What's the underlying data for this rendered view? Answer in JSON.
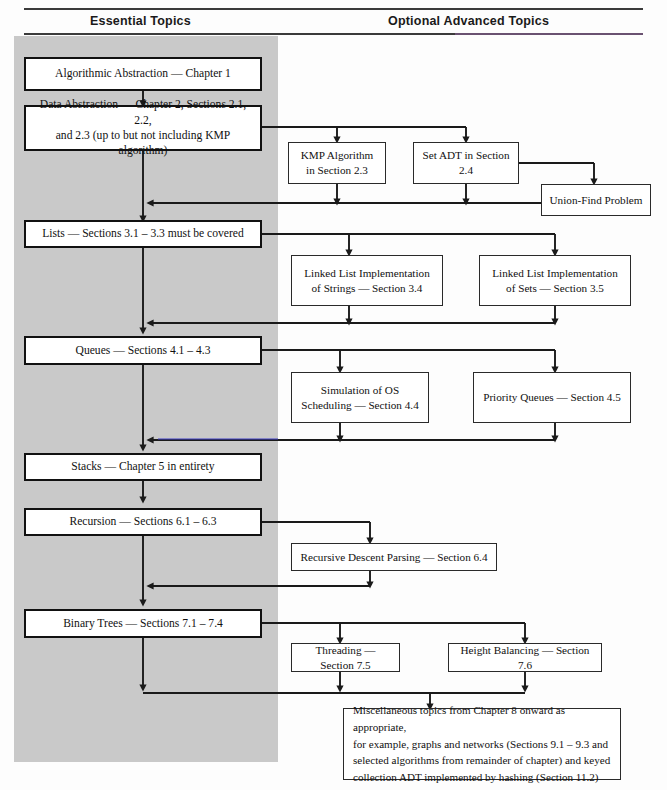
{
  "page": {
    "width": 667,
    "height": 790,
    "background": "#fdfdfd",
    "panel_color": "#c9c9c9",
    "line_color": "#1a1a1a"
  },
  "headers": {
    "left": "Essential Topics",
    "right": "Optional Advanced Topics"
  },
  "essential": {
    "algorithmic_abstraction": "Algorithmic Abstraction — Chapter 1",
    "data_abstraction": "Data Abstraction — Chapter 2, Sections 2.1, 2.2,\nand 2.3 (up to but not including KMP algorithm)",
    "lists": "Lists — Sections 3.1 – 3.3 must be covered",
    "queues": "Queues — Sections 4.1 – 4.3",
    "stacks": "Stacks — Chapter 5 in entirety",
    "recursion": "Recursion — Sections 6.1 – 6.3",
    "binary_trees": "Binary Trees — Sections 7.1 – 7.4"
  },
  "optional": {
    "kmp": "KMP Algorithm\nin Section 2.3",
    "set_adt": "Set ADT in Section 2.4",
    "union_find": "Union-Find Problem",
    "linked_list_strings": "Linked List Implementation\nof Strings — Section 3.4",
    "linked_list_sets": "Linked List Implementation\nof Sets — Section 3.5",
    "simulation_os": "Simulation of OS\nScheduling — Section 4.4",
    "priority_queues": "Priority Queues — Section 4.5",
    "recursive_descent": "Recursive Descent Parsing — Section 6.4",
    "threading": "Threading — Section 7.5",
    "height_balancing": "Height Balancing — Section 7.6",
    "miscellaneous": "Miscellaneous topics from Chapter 8 onward as appropriate,\nfor example, graphs and networks (Sections 9.1 – 9.3 and\nselected algorithms from remainder of chapter) and keyed\ncollection ADT implemented by hashing (Section 11.2)"
  }
}
